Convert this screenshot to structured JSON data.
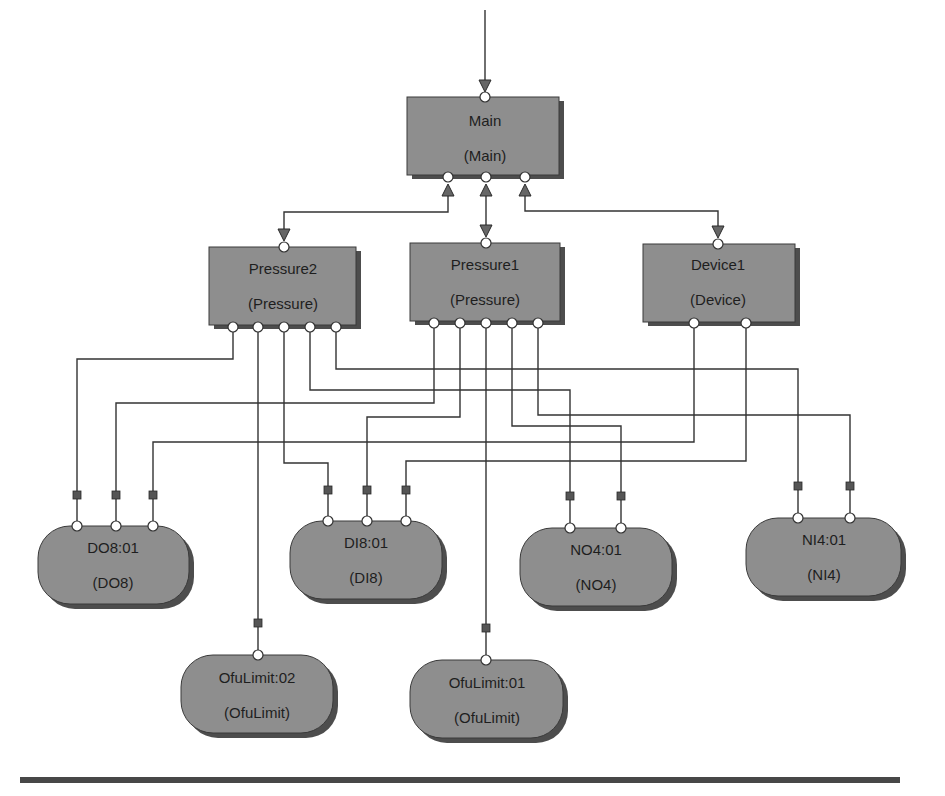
{
  "diagram": {
    "colors": {
      "node_fill": "#8e8e8e",
      "node_shadow": "#4d4d4d",
      "wire": "#333333",
      "port": "#ffffff",
      "marker": "#555555",
      "rule": "#474747"
    },
    "nodes": {
      "main": {
        "name": "Main",
        "type": "(Main)",
        "shape": "rectangle"
      },
      "pressure2": {
        "name": "Pressure2",
        "type": "(Pressure)",
        "shape": "rectangle"
      },
      "pressure1": {
        "name": "Pressure1",
        "type": "(Pressure)",
        "shape": "rectangle"
      },
      "device1": {
        "name": "Device1",
        "type": "(Device)",
        "shape": "rectangle"
      },
      "do8": {
        "name": "DO8:01",
        "type": "(DO8)",
        "shape": "rounded"
      },
      "di8": {
        "name": "DI8:01",
        "type": "(DI8)",
        "shape": "rounded"
      },
      "no4": {
        "name": "NO4:01",
        "type": "(NO4)",
        "shape": "rounded"
      },
      "ni4": {
        "name": "NI4:01",
        "type": "(NI4)",
        "shape": "rounded"
      },
      "ofulimit02": {
        "name": "OfuLimit:02",
        "type": "(OfuLimit)",
        "shape": "rounded"
      },
      "ofulimit01": {
        "name": "OfuLimit:01",
        "type": "(OfuLimit)",
        "shape": "rounded"
      }
    },
    "hierarchy_links": [
      {
        "from": "external",
        "to": "Main",
        "direction": "down"
      },
      {
        "from": "Pressure2",
        "to": "Main",
        "direction": "bidirectional"
      },
      {
        "from": "Pressure1",
        "to": "Main",
        "direction": "bidirectional"
      },
      {
        "from": "Device1",
        "to": "Main",
        "direction": "bidirectional"
      }
    ],
    "io_connections": [
      {
        "from": "Pressure2.port1",
        "to": "DO8:01.port1"
      },
      {
        "from": "Pressure2.port2",
        "to": "OfuLimit:02.port1"
      },
      {
        "from": "Pressure2.port3",
        "to": "DI8:01.port1"
      },
      {
        "from": "Pressure2.port4",
        "to": "NO4:01.port1"
      },
      {
        "from": "Pressure2.port5",
        "to": "NI4:01.port1"
      },
      {
        "from": "Pressure1.port1",
        "to": "DO8:01.port2"
      },
      {
        "from": "Pressure1.port2",
        "to": "DI8:01.port2"
      },
      {
        "from": "Pressure1.port3",
        "to": "OfuLimit:01.port1"
      },
      {
        "from": "Pressure1.port4",
        "to": "NO4:01.port2"
      },
      {
        "from": "Pressure1.port5",
        "to": "NI4:01.port2"
      },
      {
        "from": "Device1.port1",
        "to": "DO8:01.port3"
      },
      {
        "from": "Device1.port2",
        "to": "DI8:01.port3"
      }
    ]
  }
}
